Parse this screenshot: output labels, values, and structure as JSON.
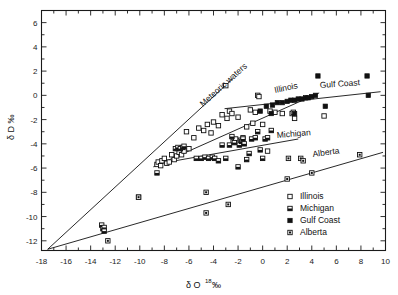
{
  "figure": {
    "background_color": "#ffffff",
    "ink_color": "#111111"
  },
  "axes": {
    "x_title_main": "δ O",
    "x_title_sup": "18",
    "x_title_unit": "‰",
    "y_title": "δ D ‰",
    "x_ticks": [
      "-18",
      "-16",
      "-14",
      "-12",
      "-10",
      "-8",
      "-6",
      "-4",
      "-2",
      "0",
      "2",
      "4",
      "6",
      "8",
      "10"
    ],
    "y_ticks": [
      "6",
      "4",
      "2",
      "0",
      "-2",
      "-4",
      "-6",
      "-8",
      "-10",
      "-12"
    ]
  },
  "annotations": {
    "meteoric": "Meteoric waters",
    "illinois": "Illinois",
    "gulf_coast": "Gulf Coast",
    "michigan": "Michigan",
    "alberta": "Alberta"
  },
  "legend": {
    "items": [
      {
        "label": "Illinois",
        "symbol": "open-square"
      },
      {
        "label": "Michigan",
        "symbol": "half-filled-square"
      },
      {
        "label": "Gulf Coast",
        "symbol": "filled-square"
      },
      {
        "label": "Alberta",
        "symbol": "dotted-square"
      }
    ]
  },
  "chart_data": {
    "type": "scatter",
    "title": "",
    "xlabel": "δ O18 ‰",
    "ylabel": "δ D ‰",
    "xlim": [
      -18,
      10
    ],
    "ylim": [
      -12.8,
      7
    ],
    "grid": false,
    "legend_position": "bottom-right",
    "series": [
      {
        "name": "Illinois",
        "symbol": "open-square",
        "points": [
          [
            -8.6,
            -5.7
          ],
          [
            -8.5,
            -5.5
          ],
          [
            -8.3,
            -5.8
          ],
          [
            -8.2,
            -5.4
          ],
          [
            -8.0,
            -5.2
          ],
          [
            -7.8,
            -5.6
          ],
          [
            -7.6,
            -5.5
          ],
          [
            -7.4,
            -4.9
          ],
          [
            -7.2,
            -5.3
          ],
          [
            -7.0,
            -5.0
          ],
          [
            -6.8,
            -4.7
          ],
          [
            -6.6,
            -4.9
          ],
          [
            -6.4,
            -4.6
          ],
          [
            -6.2,
            -3.0
          ],
          [
            -6.0,
            -4.4
          ],
          [
            -5.6,
            -3.5
          ],
          [
            -5.2,
            -2.7
          ],
          [
            -4.8,
            -2.9
          ],
          [
            -4.5,
            -2.4
          ],
          [
            -4.2,
            -3.1
          ],
          [
            -4.0,
            -2.2
          ],
          [
            -3.6,
            -2.5
          ],
          [
            -3.3,
            -1.6
          ],
          [
            -3.0,
            0.8
          ],
          [
            -2.9,
            -1.9
          ],
          [
            -2.7,
            -1.3
          ],
          [
            -2.5,
            -1.5
          ],
          [
            -2.4,
            -3.8
          ],
          [
            -2.2,
            -3.6
          ],
          [
            -2.0,
            -1.8
          ],
          [
            -1.8,
            -3.7
          ],
          [
            -1.6,
            -3.5
          ],
          [
            -1.3,
            -2.6
          ],
          [
            -1.0,
            -1.2
          ],
          [
            -0.8,
            -2.3
          ],
          [
            -0.6,
            -1.4
          ],
          [
            -0.4,
            0.0
          ],
          [
            -0.3,
            -0.1
          ],
          [
            0.0,
            -2.4
          ],
          [
            0.4,
            -4.6
          ],
          [
            0.6,
            -1.3
          ],
          [
            1.0,
            -1.4
          ],
          [
            1.6,
            -1.5
          ],
          [
            2.4,
            -1.5
          ],
          [
            2.5,
            -1.4
          ],
          [
            2.6,
            -1.9
          ],
          [
            5.0,
            -1.7
          ],
          [
            -10.1,
            -8.4
          ]
        ]
      },
      {
        "name": "Michigan",
        "symbol": "half-filled-square",
        "points": [
          [
            -13.1,
            -10.7
          ],
          [
            -13.0,
            -11.0
          ],
          [
            -12.9,
            -10.9
          ],
          [
            -12.9,
            -11.2
          ],
          [
            -8.6,
            -6.4
          ],
          [
            -7.1,
            -4.4
          ],
          [
            -6.9,
            -4.3
          ],
          [
            -6.7,
            -4.4
          ],
          [
            -6.5,
            -4.3
          ],
          [
            -6.4,
            -4.2
          ],
          [
            -5.4,
            -5.2
          ],
          [
            -5.0,
            -5.2
          ],
          [
            -4.7,
            -5.1
          ],
          [
            -4.4,
            -5.2
          ],
          [
            -4.1,
            -5.1
          ],
          [
            -3.9,
            -5.2
          ],
          [
            -3.6,
            -5.4
          ],
          [
            -3.3,
            -4.1
          ],
          [
            -3.0,
            -5.2
          ],
          [
            -2.7,
            -4.1
          ],
          [
            -2.5,
            -3.4
          ],
          [
            -2.3,
            -3.9
          ],
          [
            -2.0,
            -5.9
          ],
          [
            -1.9,
            -4.1
          ],
          [
            -1.7,
            -3.8
          ],
          [
            -1.6,
            -3.6
          ],
          [
            -1.5,
            -4.0
          ],
          [
            -1.3,
            -5.3
          ],
          [
            -1.1,
            -4.8
          ],
          [
            -0.9,
            -3.6
          ],
          [
            -0.6,
            -3.5
          ],
          [
            -0.4,
            -3.0
          ],
          [
            -0.2,
            -4.5
          ],
          [
            0.2,
            -3.6
          ],
          [
            0.4,
            -3.5
          ],
          [
            0.7,
            -2.9
          ],
          [
            0.0,
            -5.2
          ]
        ]
      },
      {
        "name": "Gulf Coast",
        "symbol": "filled-square",
        "points": [
          [
            -0.2,
            -1.3
          ],
          [
            0.3,
            -0.9
          ],
          [
            0.8,
            -0.8
          ],
          [
            1.2,
            -0.6
          ],
          [
            1.6,
            -0.6
          ],
          [
            2.0,
            -0.5
          ],
          [
            2.3,
            -0.4
          ],
          [
            2.6,
            -0.4
          ],
          [
            2.9,
            -0.3
          ],
          [
            3.2,
            -0.3
          ],
          [
            3.5,
            -0.2
          ],
          [
            3.7,
            -0.2
          ],
          [
            4.0,
            -0.1
          ],
          [
            4.3,
            0.0
          ],
          [
            4.5,
            1.6
          ],
          [
            5.1,
            -0.9
          ],
          [
            8.5,
            1.6
          ],
          [
            8.6,
            0.0
          ],
          [
            2.6,
            -1.5
          ],
          [
            0.7,
            -1.5
          ]
        ]
      },
      {
        "name": "Alberta",
        "symbol": "dotted-square",
        "points": [
          [
            -12.6,
            -12.0
          ],
          [
            -10.1,
            -8.4
          ],
          [
            -4.6,
            -8.0
          ],
          [
            -4.6,
            -9.7
          ],
          [
            -2.8,
            -9.0
          ],
          [
            2.0,
            -6.9
          ],
          [
            2.1,
            -5.2
          ],
          [
            3.1,
            -5.2
          ],
          [
            3.3,
            -5.4
          ],
          [
            4.0,
            -6.4
          ],
          [
            7.9,
            -4.9
          ]
        ]
      }
    ],
    "trend_lines": [
      {
        "name": "Meteoric waters",
        "from": [
          -17.5,
          -12.7
        ],
        "to": [
          -2.4,
          1.4
        ]
      },
      {
        "name": "Illinois",
        "from": [
          -8.9,
          -5.9
        ],
        "to": [
          4.6,
          0.2
        ]
      },
      {
        "name": "Gulf Coast",
        "from": [
          -3.1,
          -1.1
        ],
        "to": [
          9.6,
          0.3
        ]
      },
      {
        "name": "Michigan",
        "from": [
          -8.8,
          -5.7
        ],
        "to": [
          2.9,
          -3.6
        ]
      },
      {
        "name": "Alberta",
        "from": [
          -17.5,
          -12.7
        ],
        "to": [
          9.8,
          -4.7
        ]
      }
    ]
  }
}
